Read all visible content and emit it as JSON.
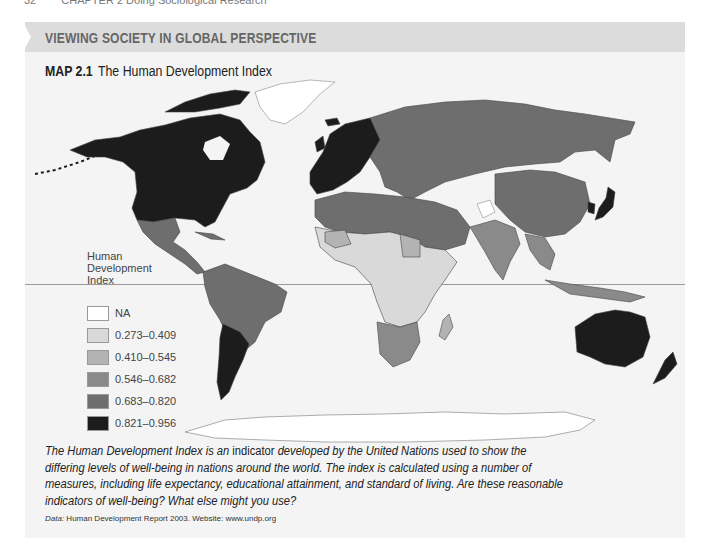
{
  "running_head": {
    "page_number": "32",
    "chapter": "CHAPTER 2  Doing Sociological Research"
  },
  "feature_band": {
    "title": "VIEWING SOCIETY IN GLOBAL PERSPECTIVE"
  },
  "map": {
    "label": "MAP 2.1",
    "title": "The Human Development Index",
    "colors": {
      "panel_bg": "#f4f4f4",
      "band_bg": "#dcdcdc",
      "na": "#ffffff",
      "c1": "#d9d9d9",
      "c2": "#b3b3b3",
      "c3": "#8a8a8a",
      "c4": "#6e6e6e",
      "c5": "#1c1c1c"
    },
    "regions": [
      {
        "name": "North America (USA, Canada)",
        "class": "0.821-0.956"
      },
      {
        "name": "Greenland",
        "class": "NA"
      },
      {
        "name": "Mexico & Central America",
        "class": "0.683-0.820"
      },
      {
        "name": "South America (most)",
        "class": "0.683-0.820"
      },
      {
        "name": "Argentina & Chile",
        "class": "0.821-0.956"
      },
      {
        "name": "Western Europe",
        "class": "0.821-0.956"
      },
      {
        "name": "Russia & Central Asia",
        "class": "0.683-0.820"
      },
      {
        "name": "China",
        "class": "0.683-0.820"
      },
      {
        "name": "Japan",
        "class": "0.821-0.956"
      },
      {
        "name": "South Korea",
        "class": "0.821-0.956"
      },
      {
        "name": "India & Southeast Asia",
        "class": "0.546-0.682"
      },
      {
        "name": "North Africa & Middle East",
        "class": "0.683-0.820"
      },
      {
        "name": "Sub-Saharan Africa",
        "class": "0.273-0.409"
      },
      {
        "name": "Southern Africa",
        "class": "0.546-0.682"
      },
      {
        "name": "Australia & New Zealand",
        "class": "0.821-0.956"
      },
      {
        "name": "Antarctica",
        "class": "NA"
      }
    ]
  },
  "legend": {
    "title": "Human Development Index",
    "title_lines": [
      "Human",
      "Development",
      "Index"
    ],
    "items": [
      {
        "label": "NA",
        "color": "#ffffff"
      },
      {
        "label": "0.273–0.409",
        "color": "#d9d9d9"
      },
      {
        "label": "0.410–0.545",
        "color": "#b3b3b3"
      },
      {
        "label": "0.546–0.682",
        "color": "#8a8a8a"
      },
      {
        "label": "0.683–0.820",
        "color": "#6e6e6e"
      },
      {
        "label": "0.821–0.956",
        "color": "#1c1c1c"
      }
    ]
  },
  "caption": {
    "part1": "The Human Development Index is an ",
    "part2": "indicator",
    "part3": " developed by the United Nations used to show the differing levels of well-being in nations around the world. The index is calculated using a number of measures, including life expectancy, educational attainment, and standard of living. Are these reasonable indicators of well-being? What else might you use?"
  },
  "source": {
    "label": "Data:",
    "text": " Human Development Report 2003. Website: www.undp.org"
  }
}
